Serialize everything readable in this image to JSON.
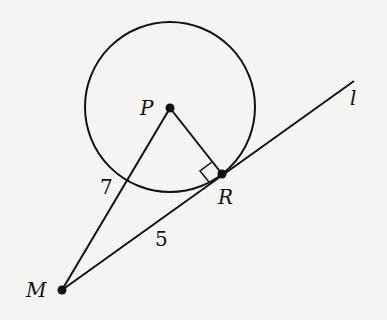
{
  "diagram": {
    "points": {
      "P": {
        "label": "P",
        "x": 170,
        "y": 108
      },
      "R": {
        "label": "R",
        "x": 222,
        "y": 174
      },
      "M": {
        "label": "M",
        "x": 62,
        "y": 290
      }
    },
    "circle": {
      "center": "P",
      "cx": 170,
      "cy": 107,
      "r": 85
    },
    "line_label": "l",
    "segment_labels": {
      "PM": "7",
      "MR": "5"
    },
    "right_angle_at": "R",
    "colors": {
      "stroke": "#111111",
      "background": "#f4f4f2"
    }
  }
}
